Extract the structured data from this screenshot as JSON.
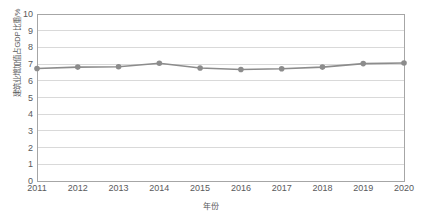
{
  "chart_data": {
    "type": "line",
    "title": "",
    "xlabel": "年份",
    "ylabel": "建筑业增加值占GDP比重/%",
    "categories": [
      "2011",
      "2012",
      "2013",
      "2014",
      "2015",
      "2016",
      "2017",
      "2018",
      "2019",
      "2020"
    ],
    "x": [
      2011,
      2012,
      2013,
      2014,
      2015,
      2016,
      2017,
      2018,
      2019,
      2020
    ],
    "values": [
      6.74,
      6.82,
      6.84,
      7.05,
      6.77,
      6.68,
      6.72,
      6.82,
      7.03,
      7.07
    ],
    "series": [
      {
        "name": "建筑业增加值占GDP比重",
        "values": [
          6.74,
          6.82,
          6.84,
          7.05,
          6.77,
          6.68,
          6.72,
          6.82,
          7.03,
          7.07
        ],
        "color": "#8c8c8c",
        "marker": "circle"
      }
    ],
    "ylim": [
      0,
      10
    ],
    "yticks": [
      0,
      1,
      2,
      3,
      4,
      5,
      6,
      7,
      8,
      9,
      10
    ],
    "ytick_labels": [
      "0",
      "1",
      "2",
      "3",
      "4",
      "5",
      "6",
      "7",
      "8",
      "9",
      "10"
    ],
    "xlim": [
      2011,
      2020
    ],
    "grid": "horizontal",
    "grid_color": "#d9d9d9",
    "legend": "none",
    "plot_border_color": "#a6a6a6",
    "background": "#ffffff",
    "text_color": "#59595b"
  }
}
